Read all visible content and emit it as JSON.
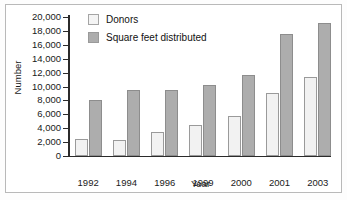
{
  "chart_data": {
    "type": "bar",
    "title": "",
    "xlabel": "Year",
    "ylabel": "Number",
    "categories": [
      "1992",
      "1994",
      "1996",
      "1999",
      "2000",
      "2001",
      "2003"
    ],
    "series": [
      {
        "name": "Donors",
        "color": "#f2f2f2",
        "values": [
          2400,
          2300,
          3400,
          4400,
          5700,
          9100,
          11400
        ]
      },
      {
        "name": "Square feet distributed",
        "color": "#adadad",
        "values": [
          8000,
          9500,
          9450,
          10200,
          11700,
          17500,
          19100
        ]
      }
    ],
    "ylim": [
      0,
      20000
    ],
    "ytick_labels": [
      "20,000",
      "18,000",
      "16,000",
      "14,000",
      "12,000",
      "10,000",
      "8,000",
      "6,000",
      "4,000",
      "2,000",
      "0"
    ],
    "ytick_values": [
      20000,
      18000,
      16000,
      14000,
      12000,
      10000,
      8000,
      6000,
      4000,
      2000,
      0
    ],
    "grid": false,
    "legend_position": "top-left"
  },
  "legend": {
    "items": [
      {
        "label": "Donors"
      },
      {
        "label": "Square feet distributed"
      }
    ]
  },
  "axes": {
    "y_title": "Number",
    "x_title": "Year"
  }
}
